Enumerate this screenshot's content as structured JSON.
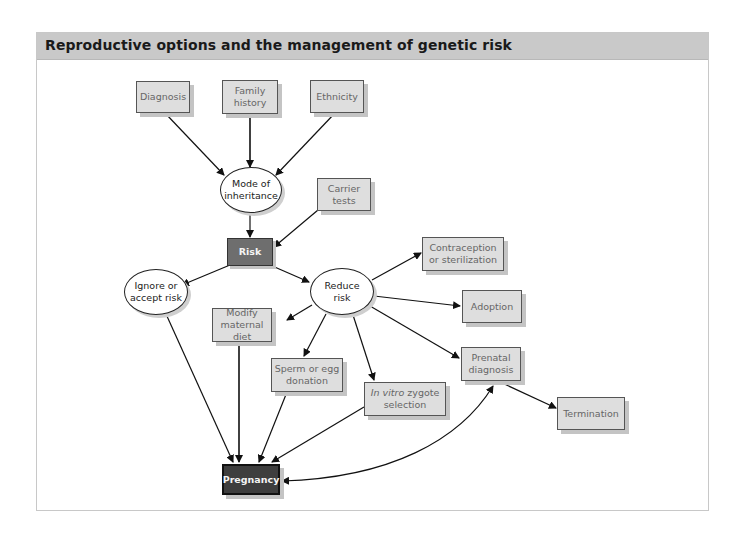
{
  "header": {
    "title": "Reproductive options and the management of genetic risk"
  },
  "nodes": {
    "diagnosis": {
      "label": "Diagnosis",
      "shape": "box"
    },
    "family_history": {
      "label": "Family\nhistory",
      "shape": "box"
    },
    "ethnicity": {
      "label": "Ethnicity",
      "shape": "box"
    },
    "mode_of_inheritance": {
      "label": "Mode of\ninheritance",
      "shape": "oval"
    },
    "carrier_tests": {
      "label": "Carrier\ntests",
      "shape": "box"
    },
    "risk": {
      "label": "Risk",
      "shape": "dark-box"
    },
    "ignore_accept": {
      "label": "Ignore or\naccept risk",
      "shape": "oval"
    },
    "reduce_risk": {
      "label": "Reduce\nrisk",
      "shape": "oval"
    },
    "contraception": {
      "label": "Contraception\nor sterilization",
      "shape": "box"
    },
    "adoption": {
      "label": "Adoption",
      "shape": "box"
    },
    "modify_diet": {
      "label": "Modify\nmaternal diet",
      "shape": "box"
    },
    "prenatal_diagnosis": {
      "label": "Prenatal\ndiagnosis",
      "shape": "box"
    },
    "sperm_egg": {
      "label": "Sperm or egg\ndonation",
      "shape": "box"
    },
    "in_vitro_italic": {
      "label": "In vitro",
      "shape": "box"
    },
    "in_vitro_rest": {
      "label": " zygote",
      "shape": "box"
    },
    "in_vitro_line2": {
      "label": "selection",
      "shape": "box"
    },
    "termination": {
      "label": "Termination",
      "shape": "box"
    },
    "pregnancy": {
      "label": "Pregnancy",
      "shape": "darkest-box"
    }
  },
  "edges": [
    [
      "Diagnosis",
      "Mode of inheritance"
    ],
    [
      "Family history",
      "Mode of inheritance"
    ],
    [
      "Ethnicity",
      "Mode of inheritance"
    ],
    [
      "Mode of inheritance",
      "Risk"
    ],
    [
      "Carrier tests",
      "Risk"
    ],
    [
      "Risk",
      "Ignore or accept risk"
    ],
    [
      "Risk",
      "Reduce risk"
    ],
    [
      "Reduce risk",
      "Contraception or sterilization"
    ],
    [
      "Reduce risk",
      "Adoption"
    ],
    [
      "Reduce risk",
      "Modify maternal diet"
    ],
    [
      "Reduce risk",
      "Sperm or egg donation"
    ],
    [
      "Reduce risk",
      "In vitro zygote selection"
    ],
    [
      "Reduce risk",
      "Prenatal diagnosis"
    ],
    [
      "Prenatal diagnosis",
      "Termination"
    ],
    [
      "Ignore or accept risk",
      "Pregnancy"
    ],
    [
      "Modify maternal diet",
      "Pregnancy"
    ],
    [
      "Sperm or egg donation",
      "Pregnancy"
    ],
    [
      "In vitro zygote selection",
      "Pregnancy"
    ],
    [
      "Pregnancy",
      "Prenatal diagnosis (bidirectional)"
    ]
  ],
  "colors": {
    "box_fill": "#dedede",
    "risk_fill": "#6e6e6e",
    "pregnancy_fill": "#3e3e3e",
    "header_bg": "#c9c9c9"
  }
}
